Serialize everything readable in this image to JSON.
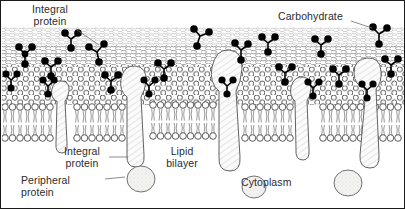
{
  "figure": {
    "style": "pen-and-ink biological illustration",
    "background_color": "#ffffff",
    "ink_color": "#2b2b2b",
    "carbohydrate_color": "#000000",
    "border_color": "#1a1a1a"
  },
  "labels": {
    "integral_protein_top": "Integral\nprotein",
    "carbohydrate": "Carbohydrate",
    "integral_protein_bottom": "Integral\nprotein",
    "peripheral_protein": "Peripheral\nprotein",
    "lipid_bilayer": "Lipid\nbilayer",
    "cytoplasm": "Cytoplasm"
  },
  "structures": {
    "membrane_surface": "hexagonal phospholipid head group mosaic",
    "bilayer_cross_section": "phospholipid heads with paired hydrocarbon tails",
    "integral_proteins": "hatched transmembrane protein bodies",
    "peripheral_proteins": "stippled globular proteins on cytoplasmic face",
    "glycoproteins": "branched beaded carbohydrate chains"
  }
}
